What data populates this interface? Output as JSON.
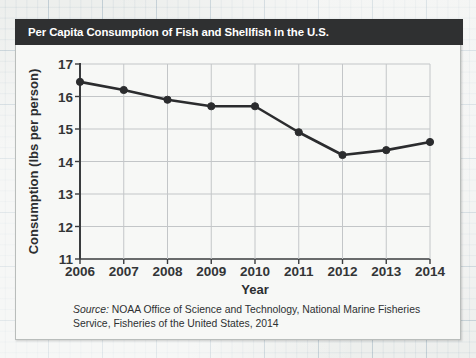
{
  "chart_data": {
    "type": "line",
    "title": "Per Capita Consumption of Fish and Shellfish in the U.S.",
    "xlabel": "Year",
    "ylabel": "Consumption (lbs per person)",
    "categories": [
      "2006",
      "2007",
      "2008",
      "2009",
      "2010",
      "2011",
      "2012",
      "2013",
      "2014"
    ],
    "values": [
      16.45,
      16.2,
      15.9,
      15.7,
      15.7,
      14.9,
      14.2,
      14.35,
      14.6
    ],
    "series": [
      {
        "name": "Per capita consumption (lbs per person)",
        "values": [
          16.45,
          16.2,
          15.9,
          15.7,
          15.7,
          14.9,
          14.2,
          14.35,
          14.6
        ]
      }
    ],
    "ylim": [
      11,
      17
    ],
    "ytick_labels": [
      "17",
      "16",
      "15",
      "14",
      "13",
      "12",
      "11"
    ],
    "ytick_values": [
      17,
      16,
      15,
      14,
      13,
      12,
      11
    ],
    "xtick_labels": [
      "2006",
      "2007",
      "2008",
      "2009",
      "2010",
      "2011",
      "2012",
      "2013",
      "2014"
    ],
    "grid": true,
    "legend": "none",
    "marker": "filled-circle",
    "line_color": "#2b2c2e",
    "grid_color": "#c3c6c8",
    "axis_color": "#3a3c3e",
    "plot_background": "#f7f8f6"
  },
  "header": {
    "title": "Per Capita Consumption of Fish and Shellfish in the U.S.",
    "background_color": "#2f3031",
    "text_color": "#ffffff"
  },
  "axes": {
    "y": {
      "label": "Consumption (lbs per person)",
      "ticks": [
        "17",
        "16",
        "15",
        "14",
        "13",
        "12",
        "11"
      ]
    },
    "x": {
      "label": "Year",
      "ticks": [
        "2006",
        "2007",
        "2008",
        "2009",
        "2010",
        "2011",
        "2012",
        "2013",
        "2014"
      ]
    }
  },
  "footer": {
    "source_word": "Source:",
    "source_text": " NOAA Office of Science and Technology, National Marine Fisheries Service, Fisheries of the United States, 2014"
  }
}
